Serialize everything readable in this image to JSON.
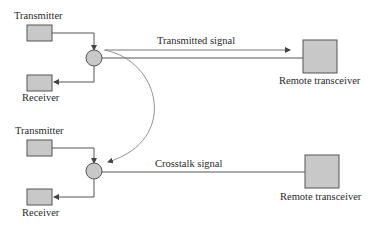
{
  "diagram": {
    "top": {
      "transmitter_label": "Transmitter",
      "receiver_label": "Receiver",
      "signal_label": "Transmitted signal",
      "remote_label": "Remote transceiver"
    },
    "bottom": {
      "transmitter_label": "Transmitter",
      "receiver_label": "Receiver",
      "signal_label": "Crosstalk signal",
      "remote_label": "Remote transceiver"
    },
    "colors": {
      "box_fill": "#c8c8c8",
      "box_stroke": "#555555",
      "line": "#555555",
      "text": "#2a2a2a"
    }
  }
}
